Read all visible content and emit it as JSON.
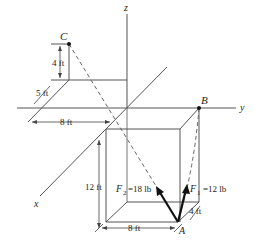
{
  "diagram": {
    "axes": {
      "x_label": "x",
      "y_label": "y",
      "z_label": "z"
    },
    "points": {
      "A": "A",
      "B": "B",
      "C": "C"
    },
    "dimensions": {
      "c_height": "4 ft",
      "c_offset_x": "5 ft",
      "c_offset_y": "8 ft",
      "box_height": "12 ft",
      "box_width": "8 ft",
      "box_depth": "4 ft"
    },
    "forces": {
      "f1": {
        "symbol": "F",
        "subscript": "1",
        "value": "=12 lb"
      },
      "f2": {
        "symbol": "F",
        "subscript": "2",
        "value": "=18 lb"
      }
    },
    "colors": {
      "line": "#4a4a4a",
      "force": "#111111",
      "text": "#231f20"
    }
  }
}
